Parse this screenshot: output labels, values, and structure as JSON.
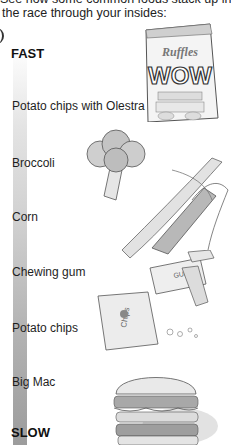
{
  "intro": {
    "line1_partial": "See how some common foods stack up in",
    "line2": "the race through your insides:"
  },
  "scale": {
    "top_label": "FAST",
    "bottom_label": "SLOW",
    "gradient_colors": [
      "#ffffff",
      "#9c9c9c"
    ]
  },
  "foods": [
    {
      "label": "Potato chips with Olestra",
      "illustration": "chips-bag-wow-icon"
    },
    {
      "label": "Broccoli",
      "illustration": "broccoli-icon"
    },
    {
      "label": "Corn",
      "illustration": "corn-cob-icon"
    },
    {
      "label": "Chewing gum",
      "illustration": "gum-pack-icon"
    },
    {
      "label": "Potato chips",
      "illustration": "chips-bag-icon"
    },
    {
      "label": "Big Mac",
      "illustration": "burger-icon"
    }
  ],
  "illustration_text": {
    "bag_brand": "Ruffles",
    "bag_headline": "WOW",
    "gum_text": "GUM",
    "chips_text": "Chips"
  }
}
